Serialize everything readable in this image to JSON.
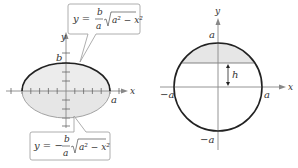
{
  "figure_left": {
    "title": "Ellipse with upper and lower halves",
    "axis_x_label": "x",
    "axis_y_label": "y",
    "label_b": "b",
    "label_a": "a",
    "upper_equation": {
      "lhs": "y =",
      "num": "b",
      "den": "a",
      "radicand": "a² − x²"
    },
    "lower_equation": {
      "lhs": "y = −",
      "num": "b",
      "den": "a",
      "radicand": "a² − x²"
    },
    "colors": {
      "fill": "#e6e6e6",
      "curve": "#222222",
      "axis": "#888888",
      "callout_border": "#999999"
    }
  },
  "figure_right": {
    "title": "Circle with shaded cap above height h",
    "axis_x_label": "x",
    "axis_y_label": "y",
    "label_top": "a",
    "label_bottom": "−a",
    "label_left": "−a",
    "label_right": "a",
    "label_h": "h",
    "colors": {
      "fill": "#e6e6e6",
      "curve": "#222222",
      "axis": "#888888"
    }
  }
}
